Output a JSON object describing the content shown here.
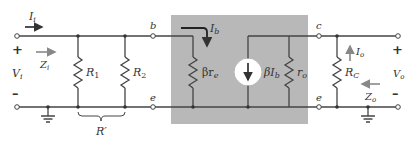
{
  "diagram": {
    "type": "circuit-schematic",
    "colors": {
      "background": "#ffffff",
      "wire": "#444444",
      "shaded_model": "#b5b5b5",
      "source_fill": "#ffffff",
      "arrow": "#333333",
      "gray_arrow": "#888888"
    },
    "input": {
      "current_label": "I",
      "current_sub": "i",
      "impedance_label": "Z",
      "impedance_sub": "i",
      "voltage_label": "V",
      "voltage_sub": "i",
      "plus": "+",
      "minus": "–"
    },
    "resistors": {
      "r1_label": "R",
      "r1_sub": "1",
      "r2_label": "R",
      "r2_sub": "2",
      "rprime_label": "R′",
      "rbe_label": "βr",
      "rbe_sub": "e",
      "ro_label": "r",
      "ro_sub": "o",
      "rc_label": "R",
      "rc_sub": "C"
    },
    "nodes": {
      "base": "b",
      "emitter_in": "e",
      "collector": "c",
      "emitter_out": "e"
    },
    "transistor_model": {
      "base_current_label": "I",
      "base_current_sub": "b",
      "source_label": "βI",
      "source_sub": "b"
    },
    "output": {
      "current_label": "I",
      "current_sub": "o",
      "impedance_label": "Z",
      "impedance_sub": "o",
      "voltage_label": "V",
      "voltage_sub": "o",
      "plus": "+",
      "minus": "–"
    }
  }
}
